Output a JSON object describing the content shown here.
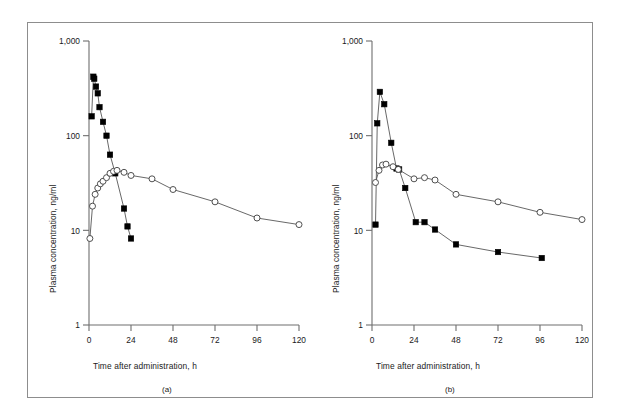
{
  "figure": {
    "caption_a": "(a)",
    "caption_b": "(b)",
    "border_color": "#8d8d8d",
    "marker_filled_color": "#000000",
    "marker_open_color": "#ffffff",
    "line_color": "#4d4d4d"
  },
  "chart_data": [
    {
      "type": "line",
      "panel": "(a)",
      "title": "",
      "xlabel": "Time after administration, h",
      "ylabel": "Plasma concentration, ng/ml",
      "xlim": [
        0,
        120
      ],
      "ylim": [
        1,
        1000
      ],
      "yscale": "log",
      "xscale": "linear",
      "grid": false,
      "legend": "none",
      "xticks": [
        0,
        24,
        48,
        72,
        96,
        120
      ],
      "xtick_labels": [
        "0",
        "24",
        "48",
        "72",
        "96",
        "120"
      ],
      "yticks": [
        1,
        10,
        100,
        1000
      ],
      "ytick_labels": [
        "1",
        "10",
        "100",
        "1,000"
      ],
      "series": [
        {
          "name": "filled-square-series",
          "marker": "filled-square",
          "x": [
            1.5,
            2.5,
            3,
            4,
            5,
            6,
            8,
            10,
            12,
            15,
            20,
            22,
            24
          ],
          "y": [
            160,
            420,
            400,
            330,
            280,
            200,
            140,
            100,
            63,
            40,
            17,
            11,
            8.2
          ]
        },
        {
          "name": "open-circle-series",
          "marker": "open-circle",
          "x": [
            0.5,
            2,
            3.5,
            5,
            6.5,
            8,
            10,
            12,
            14,
            16,
            20,
            24,
            36,
            48,
            72,
            96,
            120
          ],
          "y": [
            8.2,
            18,
            24,
            28,
            31,
            33,
            36,
            40,
            42,
            43,
            41,
            38,
            35,
            27,
            20,
            13.5,
            11.5
          ]
        }
      ]
    },
    {
      "type": "line",
      "panel": "(b)",
      "title": "",
      "xlabel": "Time after administration, h",
      "ylabel": "Plasma concentration, ng/ml",
      "xlim": [
        0,
        120
      ],
      "ylim": [
        1,
        1000
      ],
      "yscale": "log",
      "xscale": "linear",
      "grid": false,
      "legend": "none",
      "xticks": [
        0,
        24,
        48,
        72,
        96,
        120
      ],
      "xtick_labels": [
        "0",
        "24",
        "48",
        "72",
        "96",
        "120"
      ],
      "yticks": [
        1,
        10,
        100,
        1000
      ],
      "ytick_labels": [
        "1",
        "10",
        "100",
        "1,000"
      ],
      "series": [
        {
          "name": "filled-square-series",
          "marker": "filled-square",
          "x": [
            2,
            3,
            4.5,
            7,
            11,
            14,
            15.5,
            19,
            25,
            30,
            36,
            48,
            72,
            97
          ],
          "y": [
            11.5,
            135,
            290,
            215,
            84,
            45,
            44,
            28,
            12.2,
            12.2,
            10.2,
            7.1,
            5.9,
            5.1
          ]
        },
        {
          "name": "open-circle-series",
          "marker": "open-circle",
          "x": [
            2,
            4,
            6,
            8,
            12,
            15,
            24,
            30,
            36,
            48,
            72,
            96,
            120
          ],
          "y": [
            32,
            43,
            49,
            50,
            47,
            44,
            35,
            36,
            34,
            24,
            20,
            15.5,
            13
          ]
        }
      ]
    }
  ]
}
